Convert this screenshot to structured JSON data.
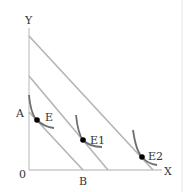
{
  "diagram": {
    "axes": {
      "y_label": "Y",
      "x_label": "X",
      "origin_label": "0"
    },
    "intercept_labels": {
      "a": "A",
      "b": "B"
    },
    "points": [
      {
        "label": "E"
      },
      {
        "label": "E1"
      },
      {
        "label": "E2"
      }
    ],
    "colors": {
      "axis": "#c8c8c8",
      "budget_line": "#b4b4b4",
      "curve": "#6e6e6e",
      "point": "#000000",
      "text": "#333333",
      "frame": "#e0e0e0"
    }
  }
}
